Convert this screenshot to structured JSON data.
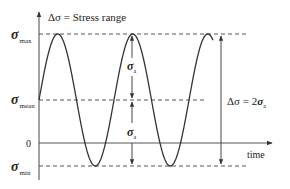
{
  "diagram": {
    "title_label": "Δσ = Stress range",
    "y_labels": {
      "max": {
        "sym": "σ",
        "sub": "max"
      },
      "mean": {
        "sym": "σ",
        "sub": "mean"
      },
      "zero": "0",
      "min": {
        "sym": "σ",
        "sub": "min"
      }
    },
    "amplitude_label": {
      "sym": "σ",
      "sub": "a"
    },
    "range_label": {
      "prefix": "Δσ = 2",
      "sym": "σ",
      "sub": "a"
    },
    "x_axis_label": "time",
    "colors": {
      "curve": "#333333",
      "axis": "#444444",
      "dashed": "#555555",
      "text": "#222222"
    }
  }
}
